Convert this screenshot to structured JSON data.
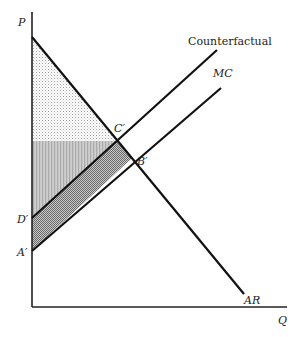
{
  "diagram": {
    "type": "economics-monopoly-welfare",
    "axes": {
      "y_label": "P",
      "x_label": "Q"
    },
    "curves": [
      {
        "id": "ar",
        "label": "AR",
        "from": [
          32,
          37
        ],
        "to": [
          244,
          294
        ]
      },
      {
        "id": "counterfactual",
        "label": "Counterfactual",
        "from": [
          32,
          218
        ],
        "to": [
          217,
          50
        ]
      },
      {
        "id": "mc",
        "label": "MC",
        "from": [
          32,
          251
        ],
        "to": [
          221,
          88
        ]
      }
    ],
    "points": [
      {
        "id": "c-prime",
        "label": "C′"
      },
      {
        "id": "b-prime",
        "label": "B′"
      },
      {
        "id": "d-prime",
        "label": "D′"
      },
      {
        "id": "a-prime",
        "label": "A′"
      }
    ],
    "regions": [
      {
        "id": "consumer-surplus",
        "fill": "dotted-light",
        "color": "#d6d6d6"
      },
      {
        "id": "producer-surplus-counterfactual",
        "fill": "vertical-stripes",
        "color": "#bdbdbd"
      },
      {
        "id": "cost-difference",
        "fill": "checkered-dark",
        "color": "#9a9a9a"
      }
    ],
    "colors": {
      "line": "#111111",
      "background": "#ffffff"
    }
  }
}
